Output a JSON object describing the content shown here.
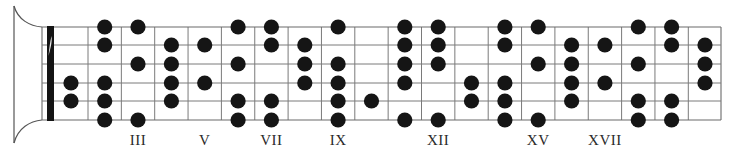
{
  "diagram": {
    "type": "guitar-fretboard-scale-diagram",
    "string_count": 6,
    "fret_count": 20,
    "geometry": {
      "board_left": 42,
      "nut_x": 47,
      "nut_width": 7,
      "first_fret_x": 88,
      "fret_spacing": 33.35,
      "board_right": 721,
      "string_y": [
        27,
        45,
        64,
        83,
        101,
        120
      ],
      "dot_radius": 7.6,
      "label_y": 145
    },
    "colors": {
      "dot": "#151515",
      "grid": "#7a7a7a",
      "nut": "#141414",
      "label": "#2a2a2a"
    },
    "position_markers": [
      {
        "fret": 3,
        "label": "III"
      },
      {
        "fret": 5,
        "label": "V"
      },
      {
        "fret": 7,
        "label": "VII"
      },
      {
        "fret": 9,
        "label": "IX"
      },
      {
        "fret": 12,
        "label": "XII"
      },
      {
        "fret": 15,
        "label": "XV"
      },
      {
        "fret": 17,
        "label": "XVII"
      }
    ],
    "dots_by_fret": [
      {
        "fret": 1,
        "strings": [
          4,
          5
        ]
      },
      {
        "fret": 2,
        "strings": [
          1,
          2,
          4,
          5,
          6
        ]
      },
      {
        "fret": 3,
        "strings": [
          1,
          3,
          6
        ]
      },
      {
        "fret": 4,
        "strings": [
          2,
          3,
          4,
          5
        ]
      },
      {
        "fret": 5,
        "strings": [
          2,
          4
        ]
      },
      {
        "fret": 6,
        "strings": [
          1,
          3,
          5,
          6
        ]
      },
      {
        "fret": 7,
        "strings": [
          1,
          2,
          5,
          6
        ]
      },
      {
        "fret": 8,
        "strings": [
          2,
          3,
          4
        ]
      },
      {
        "fret": 9,
        "strings": [
          1,
          3,
          4,
          5,
          6
        ]
      },
      {
        "fret": 10,
        "strings": [
          5
        ]
      },
      {
        "fret": 11,
        "strings": [
          1,
          2,
          3,
          4,
          6
        ]
      },
      {
        "fret": 12,
        "strings": [
          1,
          2,
          3,
          6
        ]
      },
      {
        "fret": 13,
        "strings": [
          4,
          5
        ]
      },
      {
        "fret": 14,
        "strings": [
          1,
          2,
          4,
          5,
          6
        ]
      },
      {
        "fret": 15,
        "strings": [
          1,
          3,
          6
        ]
      },
      {
        "fret": 16,
        "strings": [
          2,
          3,
          4,
          5
        ]
      },
      {
        "fret": 17,
        "strings": [
          2,
          4
        ]
      },
      {
        "fret": 18,
        "strings": [
          1,
          3,
          5,
          6
        ]
      },
      {
        "fret": 19,
        "strings": [
          1,
          2,
          5,
          6
        ]
      },
      {
        "fret": 20,
        "strings": [
          2,
          3,
          4
        ]
      }
    ]
  }
}
